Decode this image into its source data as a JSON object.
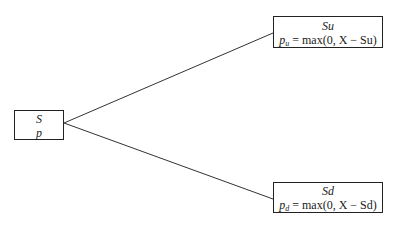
{
  "diagram": {
    "type": "binomial-tree",
    "root": {
      "line1": "S",
      "line2": "p"
    },
    "up": {
      "line1": "Su",
      "payoff_var": "p",
      "payoff_sub": "u",
      "payoff_expr": " = max(0, X − Su)"
    },
    "down": {
      "line1": "Sd",
      "payoff_var": "p",
      "payoff_sub": "d",
      "payoff_expr": " = max(0, X − Sd)"
    },
    "edges": [
      {
        "from": "root",
        "to": "up"
      },
      {
        "from": "root",
        "to": "down"
      }
    ]
  }
}
